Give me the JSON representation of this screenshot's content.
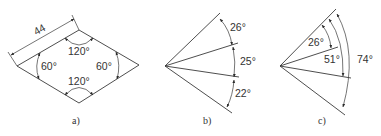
{
  "figures": [
    {
      "id": "a",
      "caption": "a)",
      "shape": "rhombus",
      "dimension_label": "44",
      "angles": {
        "top": "120°",
        "bottom": "120°",
        "left": "60°",
        "right": "60°"
      }
    },
    {
      "id": "b",
      "caption": "b)",
      "shape": "fan-of-rays",
      "angles": [
        "26°",
        "25°",
        "22°"
      ]
    },
    {
      "id": "c",
      "caption": "c)",
      "shape": "fan-of-rays",
      "angles": [
        "26°",
        "51°",
        "74°"
      ]
    }
  ]
}
